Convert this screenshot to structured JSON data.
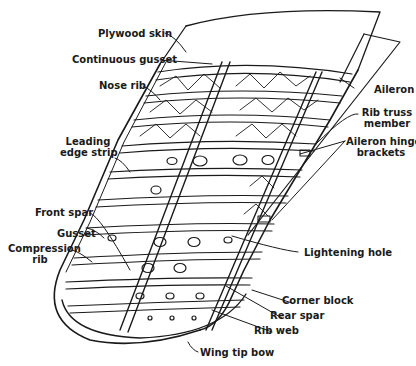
{
  "diagram": {
    "colors": {
      "ink": "#1a1a1a",
      "background": "#ffffff"
    },
    "labels": {
      "plywood_skin": "Plywood skin",
      "continuous_gusset": "Continuous gusset",
      "nose_rib": "Nose rib",
      "leading_edge_strip_1": "Leading",
      "leading_edge_strip_2": "edge strip",
      "front_spar": "Front spar",
      "gusset": "Gusset",
      "compression_rib_1": "Compression",
      "compression_rib_2": "rib",
      "aileron": "Aileron",
      "rib_truss_member_1": "Rib truss",
      "rib_truss_member_2": "member",
      "aileron_hinge_brackets_1": "Aileron hinge",
      "aileron_hinge_brackets_2": "brackets",
      "lightening_hole": "Lightening hole",
      "corner_block": "Corner block",
      "rear_spar": "Rear spar",
      "rib_web": "Rib web",
      "wing_tip_bow": "Wing tip bow"
    }
  }
}
